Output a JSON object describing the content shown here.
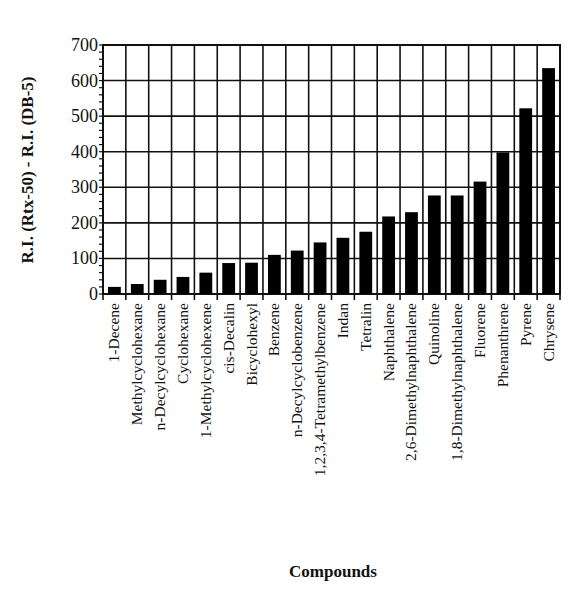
{
  "chart_data": {
    "type": "bar",
    "title": "",
    "xlabel": "Compounds",
    "ylabel": "R.I. (Rtx-50) - R.I. (DB-5)",
    "ylim": [
      0,
      700
    ],
    "yticks": [
      0,
      100,
      200,
      300,
      400,
      500,
      600,
      700
    ],
    "grid": true,
    "legend": null,
    "bar_color": "#000000",
    "categories": [
      "1-Decene",
      "Methylcyclohexane",
      "n-Decylcyclohexane",
      "Cyclohexane",
      "1-Methylcyclohexene",
      "cis-Decalin",
      "Bicyclohexyl",
      "Benzene",
      "n-Decylcyclobenzene",
      "1,2,3,4-Tetramethylbenzene",
      "Indan",
      "Tetralin",
      "Naphthalene",
      "2,6-Dimethylnaphthalene",
      "Quinoline",
      "1,8-Dimethylnaphthalene",
      "Fluorene",
      "Phenanthrene",
      "Pyrene",
      "Chrysene"
    ],
    "values": [
      20,
      28,
      40,
      48,
      60,
      87,
      88,
      110,
      122,
      145,
      158,
      175,
      218,
      230,
      277,
      277,
      316,
      398,
      522,
      635
    ]
  },
  "axes": {
    "xlabel": "Compounds",
    "ylabel": "R.I. (Rtx-50) - R.I. (DB-5)"
  }
}
